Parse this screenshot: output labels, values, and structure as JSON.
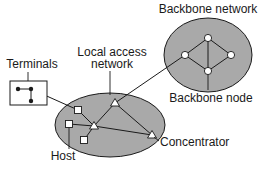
{
  "diagram": {
    "type": "network-topology",
    "labels": {
      "backbone_network": "Backbone network",
      "backbone_node": "Backbone node",
      "local_access_line1": "Local access",
      "local_access_line2": "network",
      "terminals": "Terminals",
      "concentrator": "Concentrator",
      "host": "Host"
    },
    "colors": {
      "network_fill": "#a9a9a9",
      "stroke": "#1a1a1a",
      "node_fill": "#ffffff",
      "background": "#ffffff"
    },
    "backbone_network": {
      "node_shape": "circle",
      "nodes": 4
    },
    "local_access_network": {
      "concentrators": 3,
      "concentrator_shape": "triangle",
      "hosts": 3,
      "host_shape": "square"
    },
    "terminals": {
      "count": 3,
      "shape": "dot"
    }
  }
}
